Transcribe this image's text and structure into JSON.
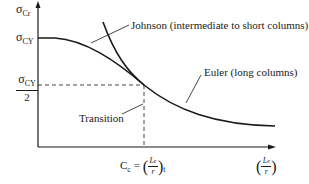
{
  "diagram": {
    "type": "column-buckling-curve",
    "y_axis": {
      "label_symbol": "σ",
      "label_subscript": "Cr",
      "ticks": [
        {
          "symbol": "σ",
          "subscript": "CY",
          "position": "top"
        },
        {
          "numerator_symbol": "σ",
          "numerator_subscript": "CY",
          "denominator": "2",
          "position": "mid"
        }
      ]
    },
    "x_axis": {
      "transition_label": {
        "prefix": "C",
        "prefix_subscript": "c",
        "equals": "=",
        "num": "L",
        "num_sub": "e",
        "den": "r",
        "outer_sub": "t"
      },
      "end_label": {
        "num": "L",
        "num_sub": "e",
        "den": "r"
      }
    },
    "curves": [
      {
        "name": "Johnson",
        "label": "Johnson (intermediate to short columns)"
      },
      {
        "name": "Euler",
        "label": "Euler (long columns)"
      }
    ],
    "annotations": {
      "transition": "Transition"
    },
    "colors": {
      "line": "#1a1a1a",
      "background": "#ffffff"
    }
  }
}
